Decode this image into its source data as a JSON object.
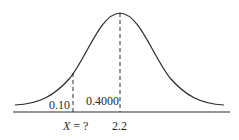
{
  "diagram": {
    "type": "normal-distribution-curve",
    "mean_label": "2.2",
    "x_label_prefix": "X",
    "x_label_suffix": " = ?",
    "left_tail_area": "0.10",
    "middle_area": "0.4000",
    "colors": {
      "curve": "#2a2a2a",
      "axis": "#2a2a2a",
      "dashed": "#2a2a2a",
      "background": "#ffffff"
    }
  }
}
